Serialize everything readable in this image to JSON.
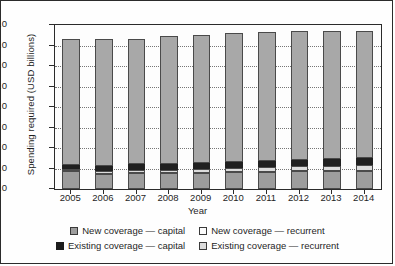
{
  "chart_data": {
    "type": "bar",
    "subtype": "stacked-vertical",
    "title": "",
    "xlabel": "Year",
    "ylabel": "Spending required (USD billions)",
    "ylim": [
      0.0,
      40.0
    ],
    "ytick_step": 5.0,
    "ytick_labels": [
      "40.0",
      "35.0",
      "30.0",
      "25.0",
      "20.0",
      "15.0",
      "10.0",
      "5.0",
      "0.0"
    ],
    "ytick_values": [
      40.0,
      35.0,
      30.0,
      25.0,
      20.0,
      15.0,
      10.0,
      5.0,
      0.0
    ],
    "grid": "horizontal-dotted",
    "legend_position": "below",
    "categories": [
      "2005",
      "2006",
      "2007",
      "2008",
      "2009",
      "2010",
      "2011",
      "2012",
      "2013",
      "2014"
    ],
    "stack_order_bottom_to_top": [
      "New coverage — capital",
      "Existing coverage — recurrent",
      "Existing coverage — capital",
      "New coverage — recurrent"
    ],
    "series": [
      {
        "name": "New coverage — capital",
        "color": "#9d9d9d",
        "values": [
          4.3,
          3.6,
          3.8,
          3.9,
          4.0,
          4.1,
          4.2,
          4.3,
          4.4,
          4.5
        ]
      },
      {
        "name": "Existing coverage — recurrent",
        "color": "#dcdcdc",
        "values": [
          0.5,
          0.8,
          0.8,
          0.8,
          0.9,
          1.0,
          1.1,
          1.2,
          1.3,
          1.4
        ]
      },
      {
        "name": "Existing coverage — capital",
        "color": "#202020",
        "values": [
          1.1,
          1.3,
          1.4,
          1.4,
          1.4,
          1.5,
          1.5,
          1.5,
          1.6,
          1.6
        ]
      },
      {
        "name": "New coverage — recurrent",
        "color": "#a8a8a8",
        "values": [
          30.8,
          31.0,
          30.7,
          31.3,
          31.2,
          31.5,
          31.6,
          31.5,
          31.2,
          31.0
        ]
      }
    ],
    "totals": [
      36.7,
      36.7,
      36.7,
      37.4,
      37.5,
      38.1,
      38.4,
      38.5,
      38.5,
      38.5
    ]
  },
  "legend": {
    "rows": [
      [
        {
          "label": "New coverage — capital",
          "swatch": "sw-newcap"
        },
        {
          "label": "New coverage — recurrent",
          "swatch": "sw-newrec"
        }
      ],
      [
        {
          "label": "Existing coverage — capital",
          "swatch": "sw-excap"
        },
        {
          "label": "Existing coverage — recurrent",
          "swatch": "sw-exrec"
        }
      ]
    ]
  }
}
